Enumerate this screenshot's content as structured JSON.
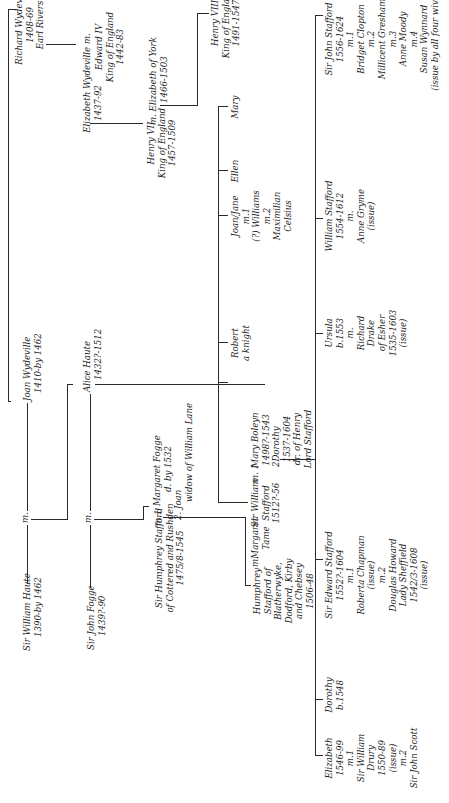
{
  "diagram": {
    "type": "family-tree",
    "orientation": "rotated 90 degrees counter-clockwise",
    "marriage_label": "m.",
    "generation_1": {
      "william_haute": {
        "name": "Sir William Haute",
        "dates": "1390-by 1462"
      },
      "joan_wydeville": {
        "name": "Joan Wydeville",
        "dates": "1410-by 1462"
      },
      "richard_wydeville": {
        "name": "Richard Wydeville",
        "dates": "1408-69",
        "title": "Earl Rivers"
      }
    },
    "generation_2": {
      "john_fogge": {
        "name": "Sir John Fogge",
        "dates": "1439?-90"
      },
      "alice_haute": {
        "name": "Alice Haute",
        "dates": "1432?-1512"
      },
      "elizabeth_wydeville": {
        "name": "Elizabeth Wydeville",
        "dates": "1437-92",
        "marriage": "m."
      },
      "edward_iv": {
        "name": "Edward IV",
        "title": "King of England",
        "dates": "1442-83"
      }
    },
    "generation_3": {
      "humphrey_stafford_sr": {
        "name": "Sir Humphrey Stafford",
        "line2": "of Cottered and Rushden",
        "dates": "1475/8-1545"
      },
      "marriage_m1": "m.1",
      "margaret_fogge": {
        "name": "Margaret Fogge",
        "dates": "d. by 1532",
        "second_marker": "2.",
        "second_name": "Joan",
        "second_note": "widow of William Lane"
      },
      "henry_vii": {
        "name": "Henry VII",
        "title": "King of England",
        "dates": "1457-1509"
      },
      "elizabeth_of_york": {
        "name": "Elizabeth of York",
        "dates": "1466-1503",
        "marriage": "m."
      },
      "henry_viii": {
        "name": "Henry VIII",
        "title": "King of England",
        "dates": "1491-1547"
      }
    },
    "generation_4": {
      "humphrey_stafford_jr": {
        "lines": [
          "Humphrey",
          "Stafford of",
          "Blatherwyke,",
          "Dodford, Kirby",
          "and Chebsey",
          "1506-48"
        ],
        "marriage": "m."
      },
      "margaret_tame": {
        "lines": [
          "Margaret",
          "Tame"
        ]
      },
      "william_stafford": {
        "lines": [
          "Sir William",
          "Stafford",
          "1512?-56"
        ],
        "marriage": "m. 1"
      },
      "mary_boleyn": {
        "lines": [
          "Mary Boleyn",
          "1498?-1543"
        ]
      },
      "dorothy_stafford": {
        "marker": "2",
        "lines": [
          "Dorothy",
          "1537-1604",
          "dr. of Henry",
          "Lord Stafford"
        ]
      },
      "robert": {
        "lines": [
          "Robert",
          "a knight"
        ]
      },
      "joan_jane": {
        "lines": [
          "Joan/Jane",
          "m.1",
          "(?) Williams",
          "m.2",
          "Maximilian",
          "Celsius"
        ]
      },
      "ellen": {
        "lines": [
          "Ellen"
        ]
      },
      "mary": {
        "lines": [
          "Mary"
        ]
      }
    },
    "generation_5": {
      "elizabeth": {
        "lines": [
          "Elizabeth",
          "1546-99",
          "m.1",
          "Sir William",
          "Drury",
          "1550-89",
          "(issue)",
          "m.2",
          "Sir John Scott"
        ]
      },
      "dorothy": {
        "lines": [
          "Dorothy",
          "b.1548"
        ]
      },
      "edward_stafford": {
        "lines": [
          "Sir Edward Stafford",
          "1552?-1604",
          "m.1",
          "Roberta Chapman",
          "(issue)",
          "m.2",
          "Douglas Howard",
          "Lady Sheffield",
          "1542/3-1608",
          "(issue)"
        ]
      },
      "ursula": {
        "lines": [
          "Ursula",
          "b.1553",
          "m.",
          "Richard",
          "Drake",
          "of Esher",
          "1535-1603",
          "(issue)"
        ]
      },
      "william_stafford_jr": {
        "lines": [
          "William Stafford",
          "1554-1612",
          "m.",
          "Anne Gryme",
          "(issue)"
        ]
      },
      "john_stafford": {
        "lines": [
          "Sir John Stafford",
          "1556-1624",
          "m.1",
          "Bridget Clopton",
          "m.2",
          "Millicent Gresham",
          "m.3",
          "Anne Moody",
          "m.4",
          "Susan Wynnard",
          "(issue by all four wives)"
        ]
      }
    }
  }
}
